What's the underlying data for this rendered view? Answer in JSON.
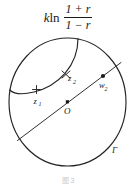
{
  "figure": {
    "formula": {
      "coefficient": "k",
      "function": "ln",
      "numerator": "1 + r",
      "denominator": "1 − r"
    },
    "labels": {
      "point_z1": "z",
      "point_z1_sub": "1",
      "point_z2": "z",
      "point_z2_sub": "2",
      "point_w2": "w",
      "point_w2_sub": "2",
      "center": "O",
      "circle": "Γ"
    },
    "caption": "图 3",
    "colors": {
      "stroke": "#242424",
      "background": "#ffffff",
      "text": "#1a1a1a",
      "caption": "#c9c9c9"
    }
  }
}
